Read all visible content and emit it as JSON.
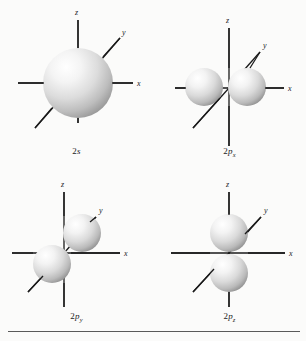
{
  "figure": {
    "background_color": "#fbfbfa",
    "line_color": "#1a1a1a",
    "sphere_light": "#ffffff",
    "sphere_mid": "#dcdcdc",
    "sphere_dark": "#8e8e8e",
    "rule_color": "#5a5a5a"
  },
  "panels": [
    {
      "key": "2s",
      "label_prefix": "2",
      "label_italic": "s",
      "label_sub": "",
      "orbital_type": "s",
      "axes": {
        "z": "z",
        "y": "y",
        "x": "x"
      },
      "lobes": 1,
      "lobe_axis": "none",
      "radius_px": 35
    },
    {
      "key": "2px",
      "label_prefix": "2",
      "label_italic": "p",
      "label_sub": "x",
      "orbital_type": "p",
      "axes": {
        "z": "z",
        "y": "y",
        "x": "x"
      },
      "lobes": 2,
      "lobe_axis": "x",
      "radius_px": 19
    },
    {
      "key": "2py",
      "label_prefix": "2",
      "label_italic": "p",
      "label_sub": "y",
      "orbital_type": "p",
      "axes": {
        "z": "z",
        "y": "y",
        "x": "x"
      },
      "lobes": 2,
      "lobe_axis": "y",
      "radius_px": 19
    },
    {
      "key": "2pz",
      "label_prefix": "2",
      "label_italic": "p",
      "label_sub": "z",
      "orbital_type": "p",
      "axes": {
        "z": "z",
        "y": "y",
        "x": "x"
      },
      "lobes": 2,
      "lobe_axis": "z",
      "radius_px": 19
    }
  ]
}
